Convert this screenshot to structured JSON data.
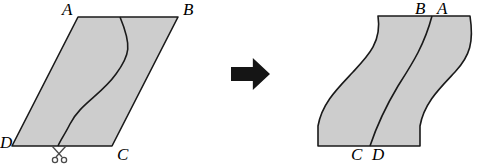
{
  "figure": {
    "background_color": "#ffffff",
    "shape_fill_color": "#cdcdcd",
    "shape_stroke_color": "#1a1a1a",
    "arrow_color": "#151515"
  },
  "left_shape": {
    "name": "parallelogram",
    "fill": "#cdcdcd",
    "stroke": "#1a1a1a",
    "stroke_width": 1.6,
    "vertices": {
      "A": {
        "x": 78,
        "y": 17
      },
      "B": {
        "x": 178,
        "y": 17
      },
      "C": {
        "x": 112,
        "y": 146
      },
      "D": {
        "x": 12,
        "y": 146
      }
    },
    "cut_curve": {
      "name": "s-curve-cut",
      "path": "M 120 17 C 132 46, 130 55, 116 74 C 101 95, 80 104, 70 124 C 65 134, 60 141, 58 146",
      "stroke": "#1a1a1a",
      "stroke_width": 1.6
    },
    "labels": [
      {
        "id": "A",
        "text": "A",
        "x": 62,
        "y": 1
      },
      {
        "id": "B",
        "text": "B",
        "x": 183,
        "y": 1
      },
      {
        "id": "C",
        "text": "C",
        "x": 117,
        "y": 146
      },
      {
        "id": "D",
        "text": "D",
        "x": 0,
        "y": 134
      }
    ]
  },
  "scissors": {
    "name": "scissors-icon",
    "label": "cut here",
    "x": 52,
    "y": 145,
    "width": 16,
    "height": 19,
    "color": "#4a4a4a"
  },
  "arrow": {
    "name": "right-arrow-icon",
    "label": "transforms into",
    "x": 231,
    "y": 58,
    "width": 39,
    "height": 32,
    "color": "#151515"
  },
  "right_shape": {
    "name": "rearranged-wave-shape",
    "fill": "#cdcdcd",
    "stroke": "#1a1a1a",
    "stroke_width": 1.6,
    "path": "M 378 16 L 470 16 C 474 42, 470 56, 455 72 C 440 88, 424 103, 420 126 L 420 146 L 318 146 L 318 126 C 322 103, 338 88, 353 72 C 368 56, 382 42, 378 16 Z",
    "top_edge": {
      "x1": 378,
      "y1": 16,
      "x2": 470,
      "y2": 16
    },
    "bottom_edge": {
      "x1": 318,
      "y1": 146,
      "x2": 420,
      "y2": 146
    },
    "seam_line": {
      "name": "seam-line",
      "path": "M 432 16 C 424 46, 412 64, 398 86 C 386 106, 376 128, 370 146",
      "stroke": "#1a1a1a",
      "stroke_width": 1.6
    },
    "labels": [
      {
        "id": "B",
        "text": "B",
        "x": 415,
        "y": 0
      },
      {
        "id": "A",
        "text": "A",
        "x": 437,
        "y": 0
      },
      {
        "id": "C",
        "text": "C",
        "x": 351,
        "y": 146
      },
      {
        "id": "D",
        "text": "D",
        "x": 372,
        "y": 146
      }
    ]
  }
}
